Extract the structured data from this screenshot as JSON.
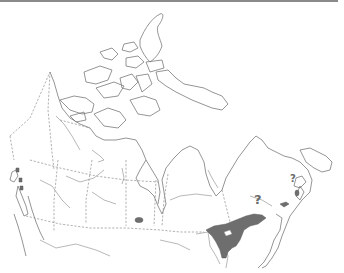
{
  "map": {
    "region": "Canada",
    "type": "species range / distribution map",
    "range_color": "#6e6e6e",
    "line_color": "#7a7a7a",
    "annotations": [
      {
        "label": "?",
        "position": "north of St. Lawrence range edge, Quebec"
      },
      {
        "label": "?",
        "position": "Gulf of St. Lawrence / Prince Edward Island area"
      }
    ],
    "shaded_ranges": [
      "Southern Ontario and St. Lawrence valley (Quebec)",
      "Small patch in southern Manitoba",
      "Small patch in New Brunswick",
      "Small patch in Nova Scotia / PEI",
      "Small patches on Vancouver Island coast, British Columbia"
    ]
  }
}
